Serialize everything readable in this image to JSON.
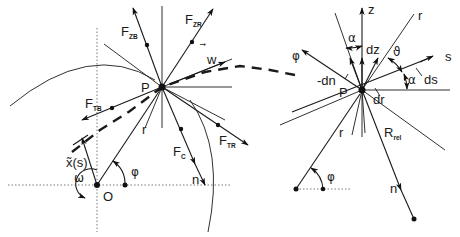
{
  "figure": {
    "left_diagram": {
      "origin_label": "O",
      "point_label": "P",
      "radius_label": "r",
      "angle_label": "φ",
      "angular_velocity_label": "ω",
      "path_label": "x̃(s)",
      "velocity_label": "w",
      "normal_label": "n",
      "forces": [
        {
          "name": "F",
          "sub": "ZB"
        },
        {
          "name": "F",
          "sub": "ZR"
        },
        {
          "name": "F",
          "sub": "TB"
        },
        {
          "name": "F",
          "sub": "TR"
        },
        {
          "name": "F",
          "sub": "C"
        }
      ]
    },
    "right_diagram": {
      "point_label": "P",
      "axes": [
        "z",
        "r",
        "s",
        "φ"
      ],
      "differentials": [
        "dz",
        "-dn",
        "ds",
        "dr"
      ],
      "angles": [
        "α",
        "ϑ",
        "α"
      ],
      "radius_label": "r",
      "relative_radius": {
        "name": "R",
        "sub": "rel"
      },
      "normal_label": "n",
      "angle_label": "φ"
    }
  },
  "colors": {
    "ink": "#1a1a1a",
    "background": "#ffffff"
  }
}
